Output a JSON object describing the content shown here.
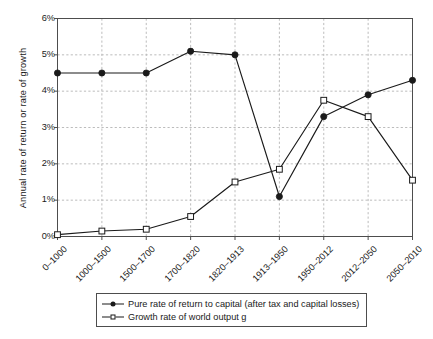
{
  "chart_data": {
    "type": "line",
    "title": "",
    "xlabel": "",
    "ylabel": "Annual rate of return or rate of growth",
    "categories": [
      "0–1000",
      "1000–1500",
      "1500–1700",
      "1700–1820",
      "1820–1913",
      "1913–1950",
      "1950–2012",
      "2012–2050",
      "2050–2010"
    ],
    "ylim": [
      0,
      6
    ],
    "yticks": [
      0,
      1,
      2,
      3,
      4,
      5,
      6
    ],
    "ytick_labels": [
      "0%",
      "1%",
      "2%",
      "3%",
      "4%",
      "5%",
      "6%"
    ],
    "grid": true,
    "legend_position": "bottom",
    "series": [
      {
        "name": "Pure rate of return to capital (after tax and capital losses)",
        "marker": "filled-circle",
        "values": [
          4.5,
          4.5,
          4.5,
          5.1,
          5.0,
          1.1,
          3.3,
          3.9,
          4.3
        ]
      },
      {
        "name": "Growth rate of world output g",
        "marker": "open-square",
        "values": [
          0.05,
          0.15,
          0.2,
          0.55,
          1.5,
          1.85,
          3.75,
          3.3,
          1.55
        ]
      }
    ]
  },
  "legend": {
    "entries": [
      {
        "label": "Pure rate of return to capital (after tax and capital losses)"
      },
      {
        "label": "Growth rate of world output g"
      }
    ]
  },
  "colors": {
    "line": "#1a1a1a",
    "grid": "#b4b4b4",
    "axis": "#4d4d4d",
    "background": "#ffffff"
  }
}
